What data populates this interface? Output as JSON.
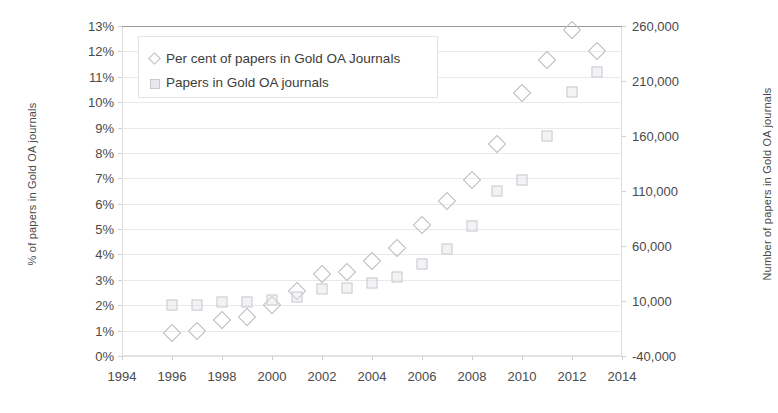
{
  "chart_data": {
    "type": "scatter",
    "title": "",
    "xlabel": "",
    "ylabel": "% of papers in Gold OA journals",
    "y2label": "Number of papers in Gold OA journals",
    "x": [
      1996,
      1997,
      1998,
      1999,
      2000,
      2001,
      2002,
      2003,
      2004,
      2005,
      2006,
      2007,
      2008,
      2009,
      2010,
      2011,
      2012,
      2013
    ],
    "xlim": [
      1994,
      2014
    ],
    "xticks": [
      "1994",
      "1996",
      "1998",
      "2000",
      "2002",
      "2004",
      "2006",
      "2008",
      "2010",
      "2012",
      "2014"
    ],
    "ylim": [
      0,
      13
    ],
    "yticks": [
      "0%",
      "1%",
      "2%",
      "3%",
      "4%",
      "5%",
      "6%",
      "7%",
      "8%",
      "9%",
      "10%",
      "11%",
      "12%",
      "13%"
    ],
    "y2lim": [
      -40000,
      260000
    ],
    "y2ticks": [
      "-40,000",
      "10,000",
      "60,000",
      "110,000",
      "160,000",
      "210,000",
      "260,000"
    ],
    "grid": true,
    "legend_position": "top-left",
    "series": [
      {
        "name": "Per cent of papers in Gold OA Journals",
        "marker": "diamond",
        "axis": "left",
        "units": "percent",
        "values": [
          0.9,
          1.0,
          1.4,
          1.55,
          2.0,
          2.55,
          3.25,
          3.3,
          3.75,
          4.25,
          5.15,
          6.1,
          6.95,
          8.35,
          10.35,
          11.65,
          12.85,
          12.0
        ]
      },
      {
        "name": "Papers in Gold OA journals",
        "marker": "square",
        "axis": "right",
        "units": "papers",
        "values": [
          6500,
          6600,
          9000,
          9300,
          11000,
          13500,
          21000,
          21500,
          26000,
          32000,
          44000,
          57000,
          78000,
          110000,
          120000,
          160000,
          200000,
          218000
        ]
      }
    ]
  },
  "legend": {
    "items": [
      {
        "label": "Per cent of papers in Gold OA Journals",
        "key": "diamond-marker-icon"
      },
      {
        "label": "Papers in Gold OA journals",
        "key": "square-marker-icon"
      }
    ]
  }
}
